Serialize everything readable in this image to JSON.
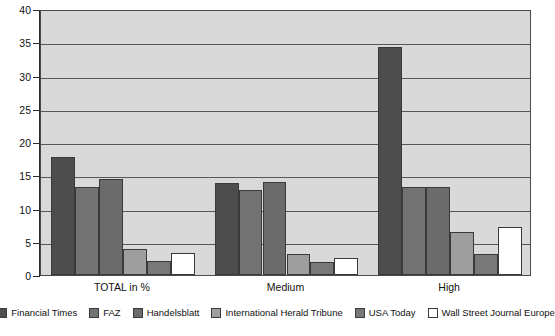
{
  "chart_data": {
    "type": "bar",
    "title": "",
    "subtitle": "",
    "xlabel": "",
    "ylabel": "",
    "ylim": [
      0,
      40
    ],
    "ytick_step": 5,
    "yticks": [
      "0",
      "5",
      "10",
      "15",
      "20",
      "25",
      "30",
      "35",
      "40"
    ],
    "grid": true,
    "grid_axis": "y",
    "legend_position": "bottom",
    "categories": [
      "TOTAL in %",
      "Medium",
      "High"
    ],
    "series": [
      {
        "name": "Financial Times",
        "color": "#4d4d4d",
        "values": [
          17.8,
          13.9,
          34.3
        ]
      },
      {
        "name": "FAZ",
        "color": "#737373",
        "values": [
          13.2,
          12.8,
          13.2
        ]
      },
      {
        "name": "Handelsblatt",
        "color": "#6b6b6b",
        "values": [
          14.4,
          14.0,
          13.2
        ]
      },
      {
        "name": "International Herald Tribune",
        "color": "#9e9e9e",
        "values": [
          3.9,
          3.2,
          6.5
        ]
      },
      {
        "name": "USA Today",
        "color": "#787878",
        "values": [
          2.1,
          2.0,
          3.1
        ]
      },
      {
        "name": "Wall Street Journal Europe",
        "color": "#ffffff",
        "values": [
          3.3,
          2.5,
          7.3
        ]
      }
    ]
  },
  "colors": {
    "plot_background": "#d9d9d9",
    "page_background": "#ffffff",
    "gridline": "#585858",
    "axis": "#2b2b2b",
    "bar_border": "#3a3a3a",
    "text": "#111111"
  }
}
